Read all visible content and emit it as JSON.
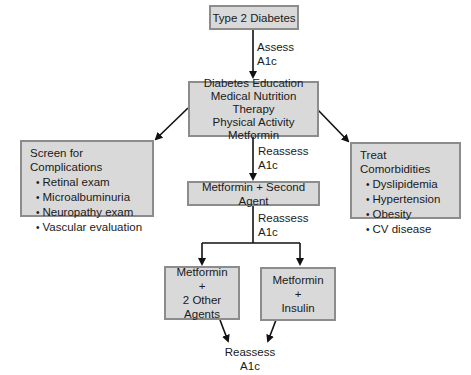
{
  "nodes": {
    "start": {
      "label": "Type 2 Diabetes"
    },
    "initial": {
      "lines": [
        "Diabetes Education",
        "Medical Nutrition Therapy",
        "Physical Activity",
        "Metformin"
      ]
    },
    "complications": {
      "title": "Screen for Complications",
      "items": [
        "Retinal exam",
        "Microalbuminuria",
        "Neuropathy exam",
        "Vascular evaluation"
      ]
    },
    "comorbidities": {
      "title": "Treat Comorbidities",
      "items": [
        "Dyslipidemia",
        "Hypertension",
        "Obesity",
        "CV disease"
      ]
    },
    "second": {
      "label": "Metformin + Second Agent"
    },
    "three": {
      "lines": [
        "Metformin",
        "+",
        "2 Other Agents"
      ]
    },
    "insulin": {
      "lines": [
        "Metformin",
        "+",
        "Insulin"
      ]
    }
  },
  "labels": {
    "assess": [
      "Assess",
      "A1c"
    ],
    "reassess1": [
      "Reassess",
      "A1c"
    ],
    "reassess2": [
      "Reassess",
      "A1c"
    ],
    "reassess_final": [
      "Reassess",
      "A1c"
    ]
  },
  "colors": {
    "box_fill": "#d9d9d9",
    "box_border": "#8c8c8c",
    "line": "#111111"
  }
}
